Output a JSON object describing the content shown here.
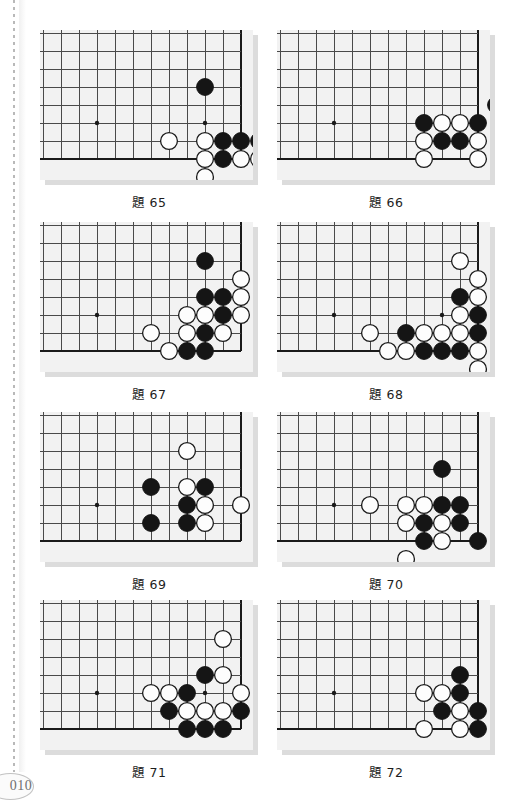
{
  "page": {
    "number": "010",
    "left_rule": "dotted-vertical-rule"
  },
  "board_spec": {
    "cols": 12,
    "rows": 8,
    "cell": 18,
    "origin_x": 3,
    "origin_y": 3,
    "star_point_col": 3,
    "star_point_row": 5,
    "note": "Lower-right corner of a go board. Column index increases left->right, row index increases top->bottom. Right edge = col 11, bottom edge = row 7."
  },
  "colors": {
    "board_bg": "#f2f2f2",
    "board_shadow": "#dcdcdc",
    "grid_line": "#4a4a4a",
    "edge_line": "#1a1a1a",
    "black_stone": "#151515",
    "white_stone": "#fdfdfd",
    "white_stone_border": "#1a1a1a",
    "caption_text": "#1d1d1d",
    "page_number": "#6e6e6e"
  },
  "problems": [
    {
      "id": "p65",
      "caption": "題 65",
      "stars": [
        [
          3,
          5
        ],
        [
          9,
          5
        ]
      ],
      "stones": [
        {
          "c": 9,
          "r": 3,
          "color": "black"
        },
        {
          "c": 7,
          "r": 6,
          "color": "white"
        },
        {
          "c": 9,
          "r": 6,
          "color": "white"
        },
        {
          "c": 10,
          "r": 6,
          "color": "black"
        },
        {
          "c": 11,
          "r": 6,
          "color": "black"
        },
        {
          "c": 9,
          "r": 7,
          "color": "white"
        },
        {
          "c": 10,
          "r": 7,
          "color": "black"
        },
        {
          "c": 11,
          "r": 7,
          "color": "white"
        },
        {
          "c": 9,
          "r": 8,
          "color": "white"
        },
        {
          "c": 12,
          "r": 6,
          "color": "black"
        },
        {
          "c": 12,
          "r": 7,
          "color": "white"
        },
        {
          "c": 13,
          "r": 7,
          "color": "black"
        }
      ]
    },
    {
      "id": "p66",
      "caption": "題 66",
      "stars": [
        [
          3,
          5
        ]
      ],
      "stones": [
        {
          "c": 12,
          "r": 4,
          "color": "black"
        },
        {
          "c": 8,
          "r": 5,
          "color": "black"
        },
        {
          "c": 9,
          "r": 5,
          "color": "white"
        },
        {
          "c": 10,
          "r": 5,
          "color": "white"
        },
        {
          "c": 11,
          "r": 5,
          "color": "black"
        },
        {
          "c": 8,
          "r": 6,
          "color": "white"
        },
        {
          "c": 9,
          "r": 6,
          "color": "black"
        },
        {
          "c": 10,
          "r": 6,
          "color": "black"
        },
        {
          "c": 11,
          "r": 6,
          "color": "white"
        },
        {
          "c": 8,
          "r": 7,
          "color": "white"
        },
        {
          "c": 11,
          "r": 7,
          "color": "white"
        }
      ]
    },
    {
      "id": "p67",
      "caption": "題 67",
      "stars": [
        [
          3,
          5
        ]
      ],
      "stones": [
        {
          "c": 9,
          "r": 2,
          "color": "black"
        },
        {
          "c": 11,
          "r": 3,
          "color": "white"
        },
        {
          "c": 9,
          "r": 4,
          "color": "black"
        },
        {
          "c": 10,
          "r": 4,
          "color": "black"
        },
        {
          "c": 11,
          "r": 4,
          "color": "white"
        },
        {
          "c": 8,
          "r": 5,
          "color": "white"
        },
        {
          "c": 9,
          "r": 5,
          "color": "white"
        },
        {
          "c": 10,
          "r": 5,
          "color": "black"
        },
        {
          "c": 11,
          "r": 5,
          "color": "white"
        },
        {
          "c": 6,
          "r": 6,
          "color": "white"
        },
        {
          "c": 8,
          "r": 6,
          "color": "white"
        },
        {
          "c": 9,
          "r": 6,
          "color": "black"
        },
        {
          "c": 10,
          "r": 6,
          "color": "white"
        },
        {
          "c": 7,
          "r": 7,
          "color": "white"
        },
        {
          "c": 8,
          "r": 7,
          "color": "black"
        },
        {
          "c": 9,
          "r": 7,
          "color": "black"
        }
      ]
    },
    {
      "id": "p68",
      "caption": "題 68",
      "stars": [
        [
          3,
          5
        ],
        [
          9,
          5
        ]
      ],
      "stones": [
        {
          "c": 10,
          "r": 2,
          "color": "white"
        },
        {
          "c": 11,
          "r": 3,
          "color": "white"
        },
        {
          "c": 10,
          "r": 4,
          "color": "black"
        },
        {
          "c": 11,
          "r": 4,
          "color": "white"
        },
        {
          "c": 10,
          "r": 5,
          "color": "white"
        },
        {
          "c": 11,
          "r": 5,
          "color": "black"
        },
        {
          "c": 5,
          "r": 6,
          "color": "white"
        },
        {
          "c": 7,
          "r": 6,
          "color": "black"
        },
        {
          "c": 8,
          "r": 6,
          "color": "white"
        },
        {
          "c": 9,
          "r": 6,
          "color": "white"
        },
        {
          "c": 10,
          "r": 6,
          "color": "white"
        },
        {
          "c": 11,
          "r": 6,
          "color": "black"
        },
        {
          "c": 6,
          "r": 7,
          "color": "white"
        },
        {
          "c": 7,
          "r": 7,
          "color": "white"
        },
        {
          "c": 8,
          "r": 7,
          "color": "black"
        },
        {
          "c": 9,
          "r": 7,
          "color": "black"
        },
        {
          "c": 10,
          "r": 7,
          "color": "black"
        },
        {
          "c": 11,
          "r": 7,
          "color": "white"
        },
        {
          "c": 11,
          "r": 8,
          "color": "white"
        }
      ]
    },
    {
      "id": "p69",
      "caption": "題 69",
      "stars": [
        [
          3,
          5
        ]
      ],
      "stones": [
        {
          "c": 8,
          "r": 2,
          "color": "white"
        },
        {
          "c": 6,
          "r": 4,
          "color": "black"
        },
        {
          "c": 8,
          "r": 4,
          "color": "white"
        },
        {
          "c": 9,
          "r": 4,
          "color": "black"
        },
        {
          "c": 8,
          "r": 5,
          "color": "black"
        },
        {
          "c": 9,
          "r": 5,
          "color": "white"
        },
        {
          "c": 11,
          "r": 5,
          "color": "white"
        },
        {
          "c": 6,
          "r": 6,
          "color": "black"
        },
        {
          "c": 8,
          "r": 6,
          "color": "black"
        },
        {
          "c": 9,
          "r": 6,
          "color": "white"
        }
      ]
    },
    {
      "id": "p70",
      "caption": "題 70",
      "stars": [
        [
          3,
          5
        ]
      ],
      "stones": [
        {
          "c": 9,
          "r": 3,
          "color": "black"
        },
        {
          "c": 5,
          "r": 5,
          "color": "white"
        },
        {
          "c": 7,
          "r": 5,
          "color": "white"
        },
        {
          "c": 8,
          "r": 5,
          "color": "white"
        },
        {
          "c": 9,
          "r": 5,
          "color": "black"
        },
        {
          "c": 10,
          "r": 5,
          "color": "black"
        },
        {
          "c": 7,
          "r": 6,
          "color": "white"
        },
        {
          "c": 8,
          "r": 6,
          "color": "black"
        },
        {
          "c": 9,
          "r": 6,
          "color": "white"
        },
        {
          "c": 10,
          "r": 6,
          "color": "black"
        },
        {
          "c": 8,
          "r": 7,
          "color": "black"
        },
        {
          "c": 9,
          "r": 7,
          "color": "white"
        },
        {
          "c": 11,
          "r": 7,
          "color": "black"
        },
        {
          "c": 7,
          "r": 8,
          "color": "white"
        }
      ]
    },
    {
      "id": "p71",
      "caption": "題 71",
      "stars": [
        [
          3,
          5
        ],
        [
          9,
          5
        ]
      ],
      "stones": [
        {
          "c": 10,
          "r": 2,
          "color": "white"
        },
        {
          "c": 9,
          "r": 4,
          "color": "black"
        },
        {
          "c": 10,
          "r": 4,
          "color": "white"
        },
        {
          "c": 6,
          "r": 5,
          "color": "white"
        },
        {
          "c": 7,
          "r": 5,
          "color": "white"
        },
        {
          "c": 8,
          "r": 5,
          "color": "black"
        },
        {
          "c": 11,
          "r": 5,
          "color": "white"
        },
        {
          "c": 7,
          "r": 6,
          "color": "black"
        },
        {
          "c": 8,
          "r": 6,
          "color": "white"
        },
        {
          "c": 9,
          "r": 6,
          "color": "white"
        },
        {
          "c": 10,
          "r": 6,
          "color": "white"
        },
        {
          "c": 11,
          "r": 6,
          "color": "black"
        },
        {
          "c": 8,
          "r": 7,
          "color": "black"
        },
        {
          "c": 9,
          "r": 7,
          "color": "black"
        },
        {
          "c": 10,
          "r": 7,
          "color": "black"
        }
      ]
    },
    {
      "id": "p72",
      "caption": "題 72",
      "stars": [
        [
          3,
          5
        ]
      ],
      "stones": [
        {
          "c": 10,
          "r": 4,
          "color": "black"
        },
        {
          "c": 8,
          "r": 5,
          "color": "white"
        },
        {
          "c": 9,
          "r": 5,
          "color": "white"
        },
        {
          "c": 10,
          "r": 5,
          "color": "black"
        },
        {
          "c": 9,
          "r": 6,
          "color": "black"
        },
        {
          "c": 10,
          "r": 6,
          "color": "white"
        },
        {
          "c": 11,
          "r": 6,
          "color": "black"
        },
        {
          "c": 8,
          "r": 7,
          "color": "white"
        },
        {
          "c": 10,
          "r": 7,
          "color": "white"
        },
        {
          "c": 11,
          "r": 7,
          "color": "black"
        }
      ]
    }
  ]
}
